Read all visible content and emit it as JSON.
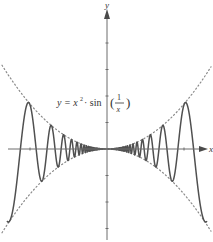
{
  "chart_data": {
    "type": "line",
    "title": "",
    "xlabel": "x",
    "ylabel": "y",
    "annotation": {
      "lhs": "y = x",
      "exp": "2",
      "op": " · sin",
      "open": "(",
      "num": "1",
      "den": "x",
      "close": ")"
    },
    "function": "y = x^2 * sin(1/x)",
    "x_ticks_units": [
      -1,
      1
    ],
    "y_ticks_units": [
      -3,
      -2,
      -1,
      1,
      2,
      3,
      4
    ],
    "xlim": [
      -1.25,
      1.3
    ],
    "ylim": [
      -3.4,
      5.1
    ],
    "series": [
      {
        "name": "curve",
        "style": "solid",
        "color": "#505050",
        "expression": "x^2 * oscillation",
        "envelope_scale": 1.7
      },
      {
        "name": "upper-envelope",
        "style": "dotted",
        "color": "#8a8a8a",
        "expression": "x^2",
        "envelope_scale": 1.7
      },
      {
        "name": "lower-envelope",
        "style": "dotted",
        "color": "#8a8a8a",
        "expression": "-x^2",
        "envelope_scale": 1.7
      }
    ],
    "oscillation_k": 15.9,
    "grid": false,
    "legend": "none"
  }
}
